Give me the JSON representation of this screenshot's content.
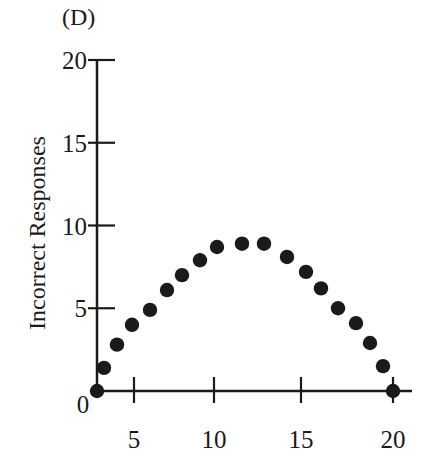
{
  "panel_label": "(D)",
  "chart_data": {
    "type": "scatter",
    "title": "(D)",
    "xlabel": "",
    "ylabel": "Incorrect Responses",
    "xlim": [
      2.7,
      20
    ],
    "ylim": [
      0,
      20
    ],
    "x_ticks": [
      5,
      10,
      15,
      20
    ],
    "y_ticks": [
      0,
      5,
      10,
      15,
      20
    ],
    "grid": false,
    "legend": null,
    "x": [
      1,
      2,
      3,
      4,
      5,
      6,
      7,
      8,
      9,
      10,
      11,
      12,
      13,
      14,
      15,
      16,
      17,
      18,
      19
    ],
    "values": [
      0,
      1.4,
      2.8,
      4.0,
      4.9,
      6.1,
      7.0,
      7.9,
      8.7,
      8.9,
      8.9,
      8.1,
      7.2,
      6.2,
      5.0,
      4.1,
      2.9,
      1.5,
      0
    ],
    "point_px_x": [
      97,
      104,
      117,
      132,
      150,
      167,
      182,
      200,
      217,
      242,
      264,
      287,
      306,
      321,
      338,
      356,
      370,
      383,
      393
    ]
  },
  "axes": {
    "origin_label": "0",
    "x_tick_labels": [
      "5",
      "10",
      "15",
      "20"
    ],
    "y_tick_labels": [
      "5",
      "10",
      "15",
      "20"
    ]
  },
  "colors": {
    "ink": "#1a1a1a",
    "background": "#ffffff"
  }
}
